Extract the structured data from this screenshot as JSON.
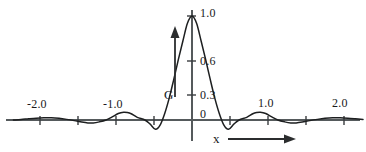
{
  "figure": {
    "background_color": "#ffffff",
    "curve_color": "#1d1f20",
    "axis_color": "#555a5c"
  },
  "axes": {
    "x_axis_label": "x",
    "y_axis_label": "G",
    "x_arrow_icon": "arrow-right-icon",
    "y_arrow_icon": "arrow-up-icon",
    "origin_label": "0"
  },
  "x_ticks": [
    {
      "value": -2.0,
      "label": "-2.0",
      "px": 40
    },
    {
      "value": -1.5,
      "label": "",
      "px": 78
    },
    {
      "value": -1.0,
      "label": "-1.0",
      "px": 116
    },
    {
      "value": -0.5,
      "label": "",
      "px": 154
    },
    {
      "value": 0.0,
      "label": "",
      "px": 192
    },
    {
      "value": 0.5,
      "label": "",
      "px": 230
    },
    {
      "value": 1.0,
      "label": "1.0",
      "px": 268
    },
    {
      "value": 1.5,
      "label": "",
      "px": 306
    },
    {
      "value": 2.0,
      "label": "2.0",
      "px": 344
    }
  ],
  "y_ticks": [
    {
      "value": 1.0,
      "label": "1.0",
      "px": 16
    },
    {
      "value": 0.6,
      "label": "0.6",
      "px": 61
    },
    {
      "value": 0.3,
      "label": "0.3",
      "px": 95
    },
    {
      "value": 0.0,
      "label": "0",
      "px": 120
    }
  ],
  "chart_data": {
    "type": "line",
    "title": "",
    "subtitle": "",
    "xlabel": "x",
    "ylabel": "G",
    "xlim": [
      -2.35,
      2.25
    ],
    "ylim": [
      -0.2,
      1.08
    ],
    "grid": false,
    "legend": null,
    "annotations": [
      {
        "text": "G",
        "kind": "axis-name-with-up-arrow"
      },
      {
        "text": "x",
        "kind": "axis-name-with-right-arrow"
      }
    ],
    "series": [
      {
        "name": "G(x)",
        "x": [
          -2.35,
          -2.25,
          -2.15,
          -2.05,
          -1.95,
          -1.85,
          -1.75,
          -1.65,
          -1.55,
          -1.45,
          -1.37,
          -1.3,
          -1.22,
          -1.13,
          -1.05,
          -0.97,
          -0.9,
          -0.85,
          -0.8,
          -0.72,
          -0.62,
          -0.55,
          -0.48,
          -0.42,
          -0.36,
          -0.3,
          -0.24,
          -0.18,
          -0.12,
          -0.06,
          0.0,
          0.06,
          0.12,
          0.18,
          0.24,
          0.3,
          0.36,
          0.42,
          0.48,
          0.55,
          0.62,
          0.72,
          0.8,
          0.85,
          0.9,
          0.97,
          1.05,
          1.13,
          1.22,
          1.3,
          1.37,
          1.45,
          1.55,
          1.65,
          1.75,
          1.85,
          1.95,
          2.05,
          2.15,
          2.25
        ],
        "y": [
          0.0,
          0.005,
          0.012,
          0.018,
          0.022,
          0.022,
          0.016,
          0.006,
          -0.006,
          -0.02,
          -0.028,
          -0.028,
          -0.018,
          0.0,
          0.03,
          0.062,
          0.075,
          0.072,
          0.06,
          0.025,
          0.0,
          -0.04,
          -0.09,
          -0.05,
          0.06,
          0.21,
          0.39,
          0.58,
          0.76,
          0.93,
          1.0,
          0.93,
          0.76,
          0.58,
          0.39,
          0.21,
          0.06,
          -0.05,
          -0.09,
          -0.04,
          0.0,
          0.025,
          0.06,
          0.072,
          0.075,
          0.062,
          0.03,
          0.0,
          -0.018,
          -0.028,
          -0.028,
          -0.02,
          -0.006,
          0.006,
          0.016,
          0.022,
          0.022,
          0.018,
          0.012,
          0.005
        ]
      }
    ]
  }
}
